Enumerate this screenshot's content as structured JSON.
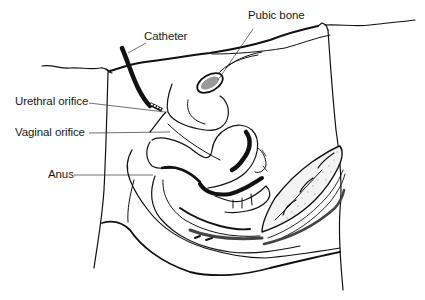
{
  "diagram": {
    "labels": {
      "catheter": "Catheter",
      "pubic_bone": "Pubic bone",
      "urethral_orifice": "Urethral orifice",
      "vaginal_orifice": "Vaginal orifice",
      "anus": "Anus"
    },
    "colors": {
      "line": "#111111",
      "background": "#ffffff",
      "leader": "#333333"
    }
  }
}
